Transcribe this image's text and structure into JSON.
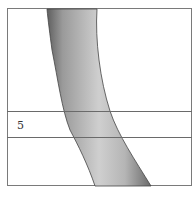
{
  "figure": {
    "region_label": "5",
    "colors": {
      "frame": "#7a7a7a",
      "band_lines": "#6a6a6a",
      "bone_light": "#d8d8d8",
      "bone_dark": "#6e6e6e"
    }
  }
}
